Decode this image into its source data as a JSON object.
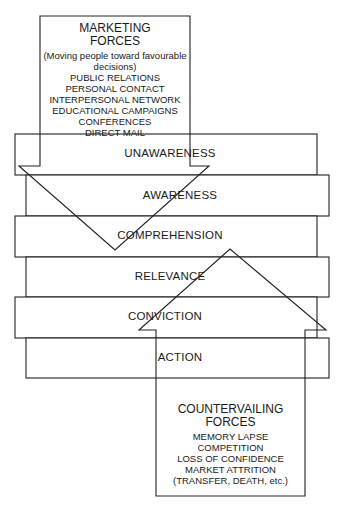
{
  "marketing_forces": {
    "title_line1": "MARKETING",
    "title_line2": "FORCES",
    "subtitle_line1": "(Moving people toward favourable",
    "subtitle_line2": "decisions)",
    "items": [
      "PUBLIC RELATIONS",
      "PERSONAL CONTACT",
      "INTERPERSONAL NETWORK",
      "EDUCATIONAL CAMPAIGNS",
      "CONFERENCES",
      "DIRECT MAIL"
    ]
  },
  "stages": [
    {
      "label": "UNAWARENESS"
    },
    {
      "label": "AWARENESS"
    },
    {
      "label": "COMPREHENSION"
    },
    {
      "label": "RELEVANCE"
    },
    {
      "label": "CONVICTION"
    },
    {
      "label": "ACTION"
    }
  ],
  "countervailing_forces": {
    "title_line1": "COUNTERVAILING",
    "title_line2": "FORCES",
    "items": [
      "MEMORY LAPSE",
      "COMPETITION",
      "LOSS OF CONFIDENCE",
      "MARKET ATTRITION",
      "(TRANSFER, DEATH, etc.)"
    ]
  }
}
